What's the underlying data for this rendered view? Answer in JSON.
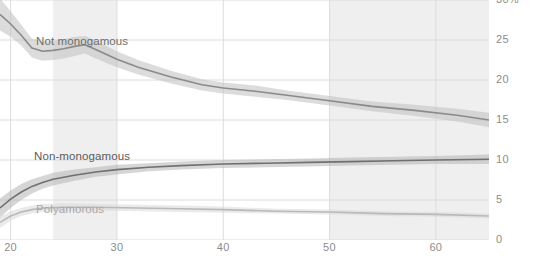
{
  "chart_data": {
    "type": "line",
    "title": "",
    "subtitle": "",
    "xlabel": "",
    "ylabel": "",
    "xlim": [
      19,
      65
    ],
    "ylim": [
      0,
      30
    ],
    "grid": true,
    "legend_position": "inline-labels",
    "y_unit": "%",
    "x_ticks": [
      20,
      30,
      40,
      50,
      60
    ],
    "x_tick_labels": [
      "20",
      "30",
      "40",
      "50",
      "60"
    ],
    "y_ticks": [
      0,
      5,
      10,
      15,
      20,
      25,
      30
    ],
    "y_tick_labels": [
      "0",
      "5",
      "10",
      "15",
      "20",
      "25",
      "30%"
    ],
    "highlight_bands": [
      {
        "name": "band-left",
        "x0": 24,
        "x1": 30,
        "color": "#efefef"
      },
      {
        "name": "band-right",
        "x0": 50,
        "x1": 65,
        "color": "#efefef"
      }
    ],
    "series": [
      {
        "name": "Not monogamous",
        "label": "Not monogamous",
        "color": "#8a8a8a",
        "band_color": "#bfbfbf",
        "x": [
          19,
          20,
          21,
          22,
          23,
          24,
          25,
          26,
          27,
          28,
          30,
          32,
          35,
          38,
          40,
          43,
          46,
          50,
          54,
          58,
          62,
          65
        ],
        "values": [
          28.2,
          27.0,
          25.6,
          24.0,
          23.6,
          23.7,
          23.9,
          24.2,
          24.4,
          23.8,
          22.6,
          21.6,
          20.4,
          19.4,
          19.0,
          18.6,
          18.1,
          17.4,
          16.7,
          16.2,
          15.6,
          15.0
        ],
        "lower": [
          26.2,
          25.4,
          24.3,
          22.8,
          22.4,
          22.5,
          22.7,
          23.0,
          23.3,
          22.7,
          21.6,
          20.7,
          19.6,
          18.7,
          18.3,
          17.9,
          17.5,
          16.8,
          16.1,
          15.5,
          14.8,
          14.1
        ],
        "upper": [
          30.2,
          28.6,
          26.9,
          25.2,
          24.8,
          24.9,
          25.1,
          25.4,
          25.5,
          24.9,
          23.6,
          22.5,
          21.2,
          20.1,
          19.7,
          19.3,
          18.7,
          18.0,
          17.3,
          16.9,
          16.4,
          15.9
        ]
      },
      {
        "name": "Non-monogamous",
        "label": "Non-monogamous",
        "color": "#707070",
        "band_color": "#b5b5b5",
        "x": [
          19,
          20,
          21,
          22,
          23,
          24,
          26,
          28,
          30,
          33,
          36,
          40,
          44,
          48,
          52,
          56,
          60,
          65
        ],
        "values": [
          4.0,
          5.1,
          6.0,
          6.7,
          7.2,
          7.6,
          8.1,
          8.5,
          8.8,
          9.1,
          9.3,
          9.5,
          9.6,
          9.7,
          9.8,
          9.9,
          10.0,
          10.1
        ],
        "lower": [
          2.8,
          4.0,
          5.0,
          5.8,
          6.4,
          6.8,
          7.4,
          7.9,
          8.2,
          8.6,
          8.8,
          9.0,
          9.1,
          9.2,
          9.3,
          9.4,
          9.5,
          9.5
        ],
        "upper": [
          5.2,
          6.2,
          7.0,
          7.6,
          8.0,
          8.4,
          8.8,
          9.1,
          9.4,
          9.6,
          9.8,
          10.0,
          10.1,
          10.2,
          10.3,
          10.4,
          10.5,
          10.7
        ]
      },
      {
        "name": "Polyamorous",
        "label": "Polyamorous",
        "color": "#b9b9b9",
        "band_color": "#d8d8d8",
        "x": [
          19,
          20,
          21,
          22,
          23,
          25,
          28,
          32,
          36,
          40,
          45,
          50,
          55,
          60,
          65
        ],
        "values": [
          2.2,
          3.0,
          3.5,
          3.8,
          4.0,
          4.1,
          4.1,
          4.0,
          3.9,
          3.8,
          3.6,
          3.5,
          3.3,
          3.2,
          3.0
        ],
        "lower": [
          1.5,
          2.4,
          3.0,
          3.3,
          3.5,
          3.6,
          3.7,
          3.6,
          3.5,
          3.4,
          3.3,
          3.2,
          3.0,
          2.9,
          2.7
        ],
        "upper": [
          2.9,
          3.6,
          4.0,
          4.3,
          4.5,
          4.6,
          4.5,
          4.4,
          4.3,
          4.2,
          3.9,
          3.8,
          3.6,
          3.5,
          3.3
        ]
      }
    ]
  },
  "axes": {
    "y_labels": [
      "30%",
      "25",
      "20",
      "15",
      "10",
      "5",
      "0"
    ],
    "x_labels": [
      "20",
      "30",
      "40",
      "50",
      "60"
    ]
  },
  "labels": {
    "not_monogamous": "Not monogamous",
    "non_monogamous": "Non-monogamous",
    "polyamorous": "Polyamorous"
  }
}
